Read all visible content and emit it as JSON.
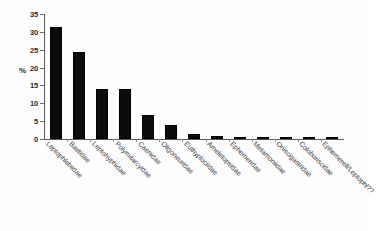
{
  "chart_data": {
    "type": "bar",
    "title": "",
    "xlabel": "",
    "ylabel": "%",
    "ylim": [
      0,
      35
    ],
    "yticks": [
      0,
      5,
      10,
      15,
      20,
      25,
      30,
      35
    ],
    "grid": false,
    "legend": false,
    "bar_color": "#0d0d0d",
    "categories": [
      "Leptophlebiidae",
      "Baetidae",
      "Leptohyphidae",
      "Polymitarcyidae",
      "Caenidae",
      "Oligoneuridae",
      "Euthyplociidae",
      "Ameletopsidae",
      "Ephemeridae",
      "Metamoniidae",
      "Oniscigastridae",
      "Coloburiscidae",
      "Ephemerell/Leptophl??"
    ],
    "values": [
      31.5,
      24.5,
      14.0,
      13.9,
      6.7,
      4.0,
      1.3,
      0.8,
      0.5,
      0.5,
      0.25,
      0.15,
      0.1
    ]
  }
}
